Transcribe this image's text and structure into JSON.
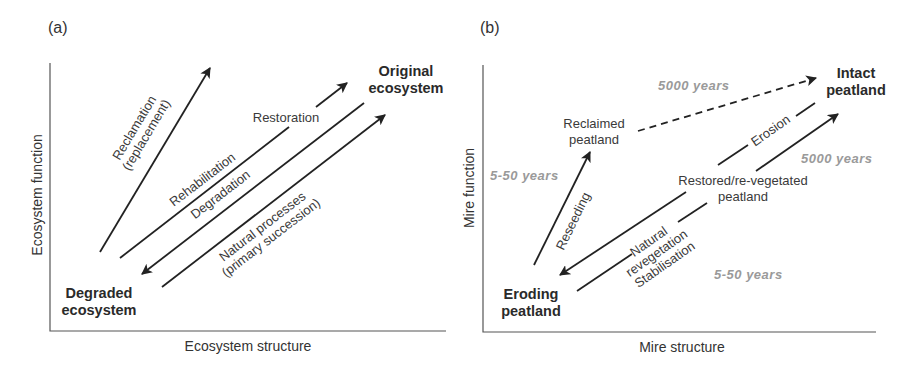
{
  "panel_a": {
    "label": "(a)",
    "x_axis": "Ecosystem structure",
    "y_axis": "Ecosystem function",
    "nodes": {
      "top": [
        "Original",
        "ecosystem"
      ],
      "bottom": [
        "Degraded",
        "ecosystem"
      ]
    },
    "arrows": {
      "reclamation": [
        "Reclamation",
        "(replacement)"
      ],
      "rehabilitation": "Rehabilitation",
      "restoration": "Restoration",
      "degradation": "Degradation",
      "natural": [
        "Natural processes",
        "(primary succession)"
      ]
    }
  },
  "panel_b": {
    "label": "(b)",
    "x_axis": "Mire structure",
    "y_axis": "Mire function",
    "nodes": {
      "intact": [
        "Intact",
        "peatland"
      ],
      "eroding": [
        "Eroding",
        "peatland"
      ],
      "reclaimed": [
        "Reclaimed",
        "peatland"
      ],
      "restored": [
        "Restored/re-vegetated",
        "peatland"
      ]
    },
    "arrows": {
      "reseeding": "Reseeding",
      "erosion": "Erosion",
      "natural": [
        "Natural",
        "revegetation",
        "Stabilisation"
      ]
    },
    "timescales": {
      "reseeding": "5-50 years",
      "reclaimed_to_intact": "5000 years",
      "restored_to_intact": "5000 years",
      "eroding_to_restored": "5-50 years"
    }
  },
  "colors": {
    "ink": "#222222",
    "timescale_grey": "#9a9a9a",
    "background": "#ffffff"
  }
}
